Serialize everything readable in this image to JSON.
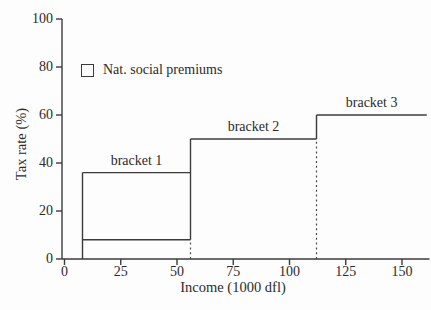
{
  "figure": {
    "background_color": "#fdfdfd",
    "line_color": "#3b3b3b",
    "text_color": "#2b2b2b"
  },
  "chart_data": {
    "type": "step",
    "title": "",
    "xlabel": "Income (1000 dfl)",
    "ylabel": "Tax rate (%)",
    "xlim": [
      0,
      150
    ],
    "ylim": [
      0,
      100
    ],
    "x_ticks": [
      0,
      25,
      50,
      75,
      100,
      125,
      150
    ],
    "y_ticks": [
      0,
      20,
      40,
      60,
      80,
      100
    ],
    "grid": false,
    "legend": {
      "marker": "open-square",
      "label": "Nat. social premiums",
      "position": "upper-left"
    },
    "brackets": [
      {
        "label": "bracket 1",
        "x_start": 8,
        "x_end": 56,
        "rate": 36
      },
      {
        "label": "bracket 2",
        "x_start": 56,
        "x_end": 112,
        "rate": 50
      },
      {
        "label": "bracket 3",
        "x_start": 112,
        "x_end": 161,
        "rate": 60
      }
    ],
    "premium_line": {
      "y": 8,
      "x_start": 8,
      "x_end": 56
    },
    "solid_verticals": [
      {
        "x": 8,
        "y_from": 0,
        "y_to": 36
      },
      {
        "x": 56,
        "y_from": 8,
        "y_to": 50
      },
      {
        "x": 112,
        "y_from": 50,
        "y_to": 60
      }
    ],
    "dashed_verticals": [
      {
        "x": 56,
        "y_from": 0,
        "y_to": 8
      },
      {
        "x": 112,
        "y_from": 0,
        "y_to": 50
      }
    ]
  }
}
